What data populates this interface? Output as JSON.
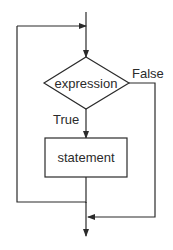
{
  "diagram": {
    "type": "flowchart",
    "nodes": {
      "condition": {
        "shape": "diamond",
        "label": "expression"
      },
      "body": {
        "shape": "rectangle",
        "label": "statement"
      }
    },
    "edges": {
      "true_label": "True",
      "false_label": "False"
    },
    "colors": {
      "line": "#2b2b2b",
      "text": "#2b2b2b",
      "background": "#ffffff"
    }
  }
}
